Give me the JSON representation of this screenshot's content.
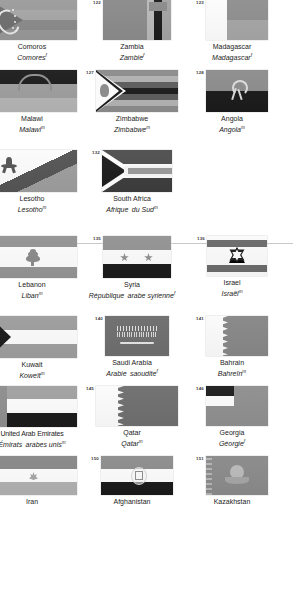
{
  "document": {
    "type": "flag-reference-page",
    "language_pair": "English / French",
    "colors": {
      "page_background": "#ffffff",
      "text": "#1b1b1b",
      "number_text": "#3c3c3c",
      "divider": "#c9c9c9",
      "grey_mid": "#9a9a9a",
      "grey_dark": "#4f4f4f",
      "grey_light": "#c8c8c8",
      "black": "#111111",
      "white": "#ffffff"
    }
  },
  "sections": [
    {
      "name": "africa",
      "rows": [
        {
          "entries": [
            {
              "number": "",
              "number_visible": false,
              "flag": "comoros",
              "en": "Comoros",
              "fr": "Comores",
              "fr_sup": "f",
              "clipped": true
            },
            {
              "number": "122",
              "number_visible": true,
              "flag": "zambia",
              "en": "Zambia",
              "fr": "Zambie",
              "fr_sup": "f",
              "clipped": false
            },
            {
              "number": "123",
              "number_visible": true,
              "flag": "madagascar",
              "en": "Madagascar",
              "fr": "Madagascar",
              "fr_sup": "f",
              "clipped": false
            }
          ]
        },
        {
          "entries": [
            {
              "number": "",
              "number_visible": false,
              "flag": "malawi",
              "en": "Malawi",
              "fr": "Malawi",
              "fr_sup": "m",
              "clipped": true
            },
            {
              "number": "127",
              "number_visible": true,
              "flag": "zimbabwe",
              "en": "Zimbabwe",
              "fr": "Zimbabwe",
              "fr_sup": "m",
              "clipped": false
            },
            {
              "number": "128",
              "number_visible": true,
              "flag": "angola",
              "en": "Angola",
              "fr": "Angola",
              "fr_sup": "m",
              "clipped": false
            }
          ]
        },
        {
          "entries": [
            {
              "number": "",
              "number_visible": false,
              "flag": "lesotho",
              "en": "Lesotho",
              "fr": "Lesotho",
              "fr_sup": "m",
              "clipped": true
            },
            {
              "number": "132",
              "number_visible": true,
              "flag": "south-africa",
              "en": "South Africa",
              "fr": "Afrique  du Sud",
              "fr_sup": "f",
              "fr_sup_after": "m",
              "clipped": false
            },
            {
              "number": "",
              "number_visible": false,
              "flag": "",
              "en": "",
              "fr": "",
              "fr_sup": "",
              "empty": true
            }
          ]
        }
      ]
    },
    {
      "name": "middle-east-asia",
      "rows": [
        {
          "entries": [
            {
              "number": "",
              "number_visible": false,
              "flag": "lebanon",
              "en": "Lebanon",
              "fr": "Liban",
              "fr_sup": "m",
              "clipped": true
            },
            {
              "number": "135",
              "number_visible": true,
              "flag": "syria",
              "en": "Syria",
              "fr": "République  arabe syrienne",
              "fr_sup": "f",
              "clipped": false
            },
            {
              "number": "136",
              "number_visible": true,
              "flag": "israel",
              "en": "Israel",
              "fr": "Israël",
              "fr_sup": "m",
              "clipped": false
            }
          ]
        },
        {
          "entries": [
            {
              "number": "",
              "number_visible": false,
              "flag": "kuwait",
              "en": "Kuwait",
              "fr": "Koweït",
              "fr_sup": "m",
              "clipped": true
            },
            {
              "number": "140",
              "number_visible": true,
              "flag": "saudi-arabia",
              "en": "Saudi Arabia",
              "fr": "Arabie  saoudite",
              "fr_sup": "f",
              "clipped": false
            },
            {
              "number": "141",
              "number_visible": true,
              "flag": "bahrain",
              "en": "Bahrain",
              "fr": "Bahreïn",
              "fr_sup": "m",
              "clipped": false
            }
          ]
        },
        {
          "entries": [
            {
              "number": "",
              "number_visible": false,
              "flag": "uae",
              "en": "United Arab Emirates",
              "fr": "Émirats  arabes unis",
              "fr_sup": "m",
              "clipped": true
            },
            {
              "number": "145",
              "number_visible": true,
              "flag": "qatar",
              "en": "Qatar",
              "fr": "Qatar",
              "fr_sup": "m",
              "clipped": false
            },
            {
              "number": "146",
              "number_visible": true,
              "flag": "georgia",
              "en": "Georgia",
              "fr": "Géorgie",
              "fr_sup": "f",
              "clipped": false
            }
          ]
        },
        {
          "entries": [
            {
              "number": "",
              "number_visible": false,
              "flag": "iran",
              "en": "Iran",
              "fr": "",
              "fr_sup": "",
              "clipped": true,
              "row_cut": true
            },
            {
              "number": "150",
              "number_visible": true,
              "flag": "afghanistan",
              "en": "Afghanistan",
              "fr": "",
              "fr_sup": "",
              "clipped": false,
              "row_cut": true
            },
            {
              "number": "151",
              "number_visible": true,
              "flag": "kazakhstan",
              "en": "Kazakhstan",
              "fr": "",
              "fr_sup": "",
              "clipped": false,
              "row_cut": true
            }
          ]
        }
      ]
    }
  ]
}
